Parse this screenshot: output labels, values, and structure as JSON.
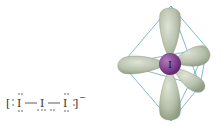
{
  "lewis": {
    "atoms": [
      "I",
      "I",
      "I"
    ],
    "bonds": [
      "—",
      "—"
    ],
    "charge": "−",
    "left_bracket": "[",
    "right_bracket": "]"
  },
  "orbital": {
    "central_atom": "I",
    "geometry": "octahedral",
    "colors": {
      "lobe": "#b9c2ad",
      "lobe_shade": "#8e9a82",
      "atom": "#7a3b86",
      "atom_highlight": "#b27cbd",
      "edges": "#5fa9c9"
    }
  }
}
